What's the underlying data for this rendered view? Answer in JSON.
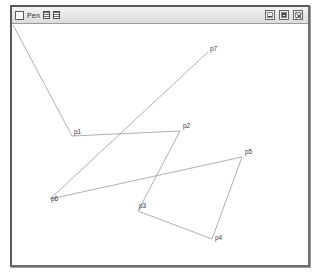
{
  "window": {
    "title": "Pen",
    "menu_icon": "window-menu-icon",
    "title_glyph_1": "grid-glyph-icon",
    "title_glyph_2": "grid-glyph-icon",
    "controls": {
      "minimize_label": "_",
      "maximize_label": "□",
      "close_label": "✕"
    },
    "border_color": "#5a5a5a",
    "titlebar_color": "#e6e6e6",
    "canvas_color": "#ffffff"
  },
  "drawing": {
    "stroke_color": "#9a9a9a",
    "label_color": "#3a3a3a",
    "canvas_width": 296,
    "canvas_height": 240,
    "path_order": [
      "start",
      "p1",
      "p2",
      "p3",
      "p4",
      "p5",
      "p6",
      "p7"
    ],
    "points": [
      {
        "id": "start",
        "label": "",
        "x": 1,
        "y": 1,
        "show_label": false,
        "label_dx": 0,
        "label_dy": 0
      },
      {
        "id": "p1",
        "label": "p1",
        "x": 60,
        "y": 112,
        "show_label": true,
        "label_dx": 2,
        "label_dy": -2
      },
      {
        "id": "p2",
        "label": "p2",
        "x": 168,
        "y": 107,
        "show_label": true,
        "label_dx": 3,
        "label_dy": -3
      },
      {
        "id": "p3",
        "label": "p3",
        "x": 126,
        "y": 187,
        "show_label": true,
        "label_dx": 1,
        "label_dy": -3
      },
      {
        "id": "p4",
        "label": "p4",
        "x": 200,
        "y": 215,
        "show_label": true,
        "label_dx": 3,
        "label_dy": 1
      },
      {
        "id": "p5",
        "label": "p5",
        "x": 230,
        "y": 133,
        "show_label": true,
        "label_dx": 3,
        "label_dy": -3
      },
      {
        "id": "p6",
        "label": "p6",
        "x": 38,
        "y": 175,
        "show_label": true,
        "label_dx": 1,
        "label_dy": 2
      },
      {
        "id": "p7",
        "label": "p7",
        "x": 196,
        "y": 28,
        "show_label": true,
        "label_dx": 2,
        "label_dy": -1
      }
    ],
    "segments": [
      {
        "from": "start",
        "to": "p1"
      },
      {
        "from": "p1",
        "to": "p2"
      },
      {
        "from": "p2",
        "to": "p3"
      },
      {
        "from": "p3",
        "to": "p4"
      },
      {
        "from": "p4",
        "to": "p5"
      },
      {
        "from": "p5",
        "to": "p6"
      },
      {
        "from": "p6",
        "to": "p7"
      }
    ]
  }
}
